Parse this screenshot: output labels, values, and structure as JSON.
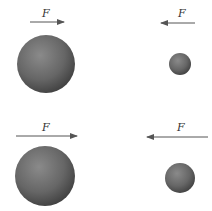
{
  "diagram": {
    "panels": [
      {
        "id": "top-left",
        "force_label": "F",
        "arrow_direction": "right",
        "sphere_size": "large"
      },
      {
        "id": "top-right",
        "force_label": "F",
        "arrow_direction": "left",
        "sphere_size": "small"
      },
      {
        "id": "bottom-left",
        "force_label": "F",
        "arrow_direction": "right",
        "sphere_size": "large"
      },
      {
        "id": "bottom-right",
        "force_label": "F",
        "arrow_direction": "left",
        "sphere_size": "medium"
      }
    ],
    "colors": {
      "sphere": "#6a6a6a",
      "arrow": "#555555",
      "background": "#ffffff"
    }
  }
}
